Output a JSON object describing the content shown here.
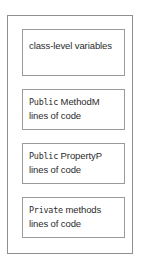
{
  "diagram": {
    "border_color": "#8f8f8f",
    "compartment_border_color": "#9a9a9a",
    "background_color": "#ffffff",
    "text_color": "#2b2b2b",
    "compartments": [
      {
        "name": "class-level-variables",
        "lines": [
          {
            "keyword": "",
            "text": "class-level variables"
          }
        ]
      },
      {
        "name": "public-method-m",
        "lines": [
          {
            "keyword": "Public",
            "text": " MethodM"
          },
          {
            "keyword": "",
            "text": "lines of code"
          }
        ]
      },
      {
        "name": "public-property-p",
        "lines": [
          {
            "keyword": "Public",
            "text": " PropertyP"
          },
          {
            "keyword": "",
            "text": "lines of code"
          }
        ]
      },
      {
        "name": "private-methods",
        "lines": [
          {
            "keyword": "Private",
            "text": " methods"
          },
          {
            "keyword": "",
            "text": "lines of code"
          }
        ]
      }
    ]
  }
}
